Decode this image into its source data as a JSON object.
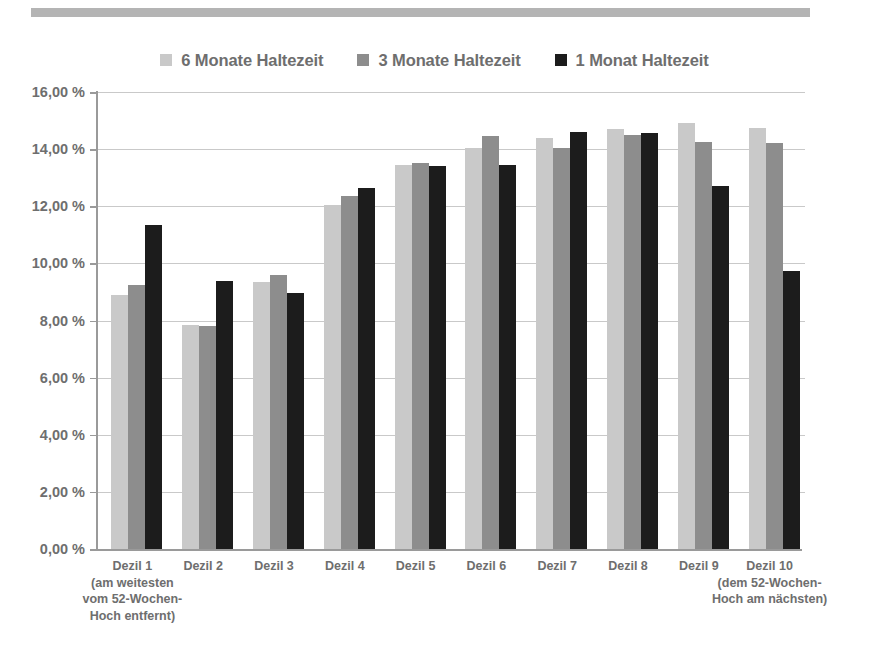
{
  "banner": {
    "name": "top-rule"
  },
  "legend": {
    "position": "top-center",
    "items": [
      {
        "label": "6 Monate Haltezeit",
        "color": "#c9c9c9"
      },
      {
        "label": "3 Monate Haltezeit",
        "color": "#8d8d8d"
      },
      {
        "label": "1 Monat Haltezeit",
        "color": "#1c1c1c"
      }
    ]
  },
  "chart_data": {
    "type": "bar",
    "title": "",
    "xlabel": "",
    "ylabel": "",
    "ylim": [
      0,
      16
    ],
    "ytick_labels": [
      "0,00 %",
      "2,00 %",
      "4,00 %",
      "6,00 %",
      "8,00 %",
      "10,00 %",
      "12,00 %",
      "14,00 %",
      "16,00 %"
    ],
    "ytick_values": [
      0,
      2,
      4,
      6,
      8,
      10,
      12,
      14,
      16
    ],
    "grid": true,
    "legend_position": "top-center",
    "categories": [
      "Dezil 1",
      "Dezil 2",
      "Dezil 3",
      "Dezil 4",
      "Dezil 5",
      "Dezil 6",
      "Dezil 7",
      "Dezil 8",
      "Dezil 9",
      "Dezil 10"
    ],
    "category_annotations": [
      "(am weitesten\nvom 52-Wochen-\nHoch entfernt)",
      "",
      "",
      "",
      "",
      "",
      "",
      "",
      "",
      "(dem 52-Wochen-\nHoch am nächsten)"
    ],
    "series": [
      {
        "name": "6 Monate Haltezeit",
        "color": "#c9c9c9",
        "values": [
          8.9,
          7.85,
          9.35,
          12.05,
          13.45,
          14.05,
          14.4,
          14.7,
          14.9,
          14.75
        ]
      },
      {
        "name": "3 Monate Haltezeit",
        "color": "#8d8d8d",
        "values": [
          9.25,
          7.8,
          9.6,
          12.35,
          13.5,
          14.45,
          14.05,
          14.5,
          14.25,
          14.2
        ]
      },
      {
        "name": "1 Monat Haltezeit",
        "color": "#1c1c1c",
        "values": [
          11.35,
          9.4,
          8.95,
          12.65,
          13.4,
          13.45,
          14.6,
          14.55,
          12.7,
          9.75
        ]
      }
    ]
  },
  "xlabels": [
    {
      "main": "Dezil 1",
      "lines": [
        "(am weitesten",
        "vom 52-Wochen-",
        "Hoch entfernt)"
      ]
    },
    {
      "main": "Dezil 2",
      "lines": []
    },
    {
      "main": "Dezil 3",
      "lines": []
    },
    {
      "main": "Dezil 4",
      "lines": []
    },
    {
      "main": "Dezil 5",
      "lines": []
    },
    {
      "main": "Dezil 6",
      "lines": []
    },
    {
      "main": "Dezil 7",
      "lines": []
    },
    {
      "main": "Dezil 8",
      "lines": []
    },
    {
      "main": "Dezil 9",
      "lines": []
    },
    {
      "main": "Dezil 10",
      "lines": [
        "(dem 52-Wochen-",
        "Hoch am nächsten)"
      ]
    }
  ]
}
